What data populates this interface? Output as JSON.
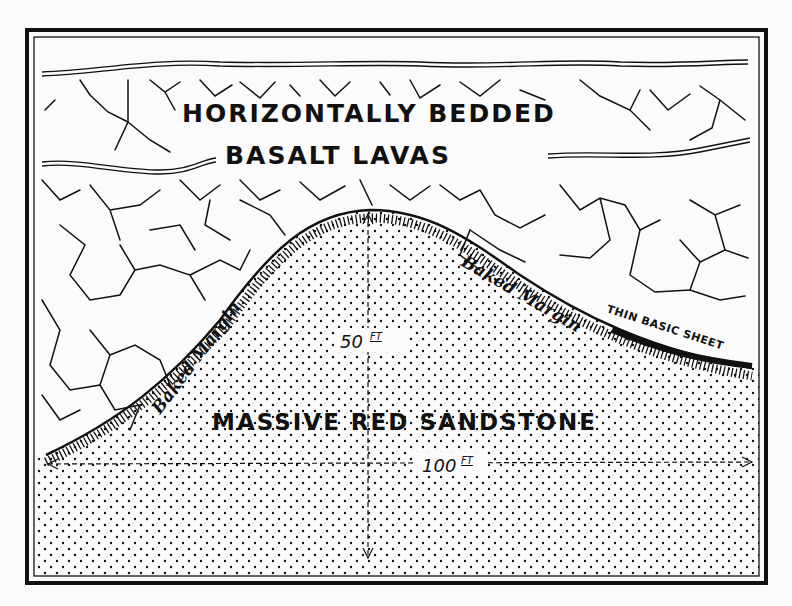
{
  "figure": {
    "labels": {
      "basalt_line1": "HORIZONTALLY BEDDED",
      "basalt_line2": "BASALT LAVAS",
      "sandstone": "MASSIVE RED SANDSTONE",
      "baked_margin_left": "Baked Margin",
      "baked_margin_right": "Baked Margin",
      "thin_sheet": "THIN BASIC SHEET",
      "height_value": "50",
      "height_unit": "FT",
      "width_value": "100",
      "width_unit": "FT"
    },
    "colors": {
      "ink": "#111111",
      "paper": "#fbfbfb"
    }
  }
}
